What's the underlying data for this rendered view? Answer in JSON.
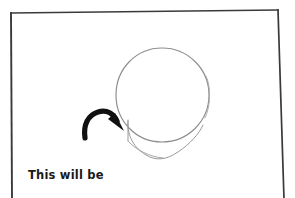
{
  "scene": {
    "kind": "hand-drawn-tutorial-frame",
    "background_color": "#ffffff",
    "ink_color": "#1a1a1a",
    "pencil_color": "#8a8a8a"
  },
  "frame": {
    "name": "paper-border",
    "stroke_color": "#3a3a3c",
    "stroke_width": 1.6,
    "corners": {
      "top_left": [
        11,
        13
      ],
      "top_right": [
        278,
        10
      ],
      "right_bottom": [
        284,
        198
      ],
      "left_bottom": [
        12,
        198
      ]
    }
  },
  "drawing": {
    "head_circle": {
      "name": "head-circle",
      "center_x": 162,
      "center_y": 95,
      "radius_x": 46,
      "radius_y": 47,
      "stroke_color": "#8d8d8d",
      "stroke_width": 1.1
    },
    "jaw_line": {
      "name": "jaw-line",
      "stroke_color": "#9a9a9a",
      "stroke_width": 1.0,
      "start": [
        128,
        122
      ],
      "chin": [
        163,
        159
      ],
      "end": [
        202,
        126
      ]
    },
    "cheek_line": {
      "name": "cheek-line",
      "stroke_color": "#9a9a9a",
      "stroke_width": 1.0,
      "start": [
        128,
        122
      ],
      "end": [
        128,
        140
      ]
    }
  },
  "arrow": {
    "name": "curved-pointer-arrow",
    "color": "#111111",
    "stroke_width": 5,
    "tail": [
      84,
      137
    ],
    "head": [
      121,
      129
    ],
    "direction": "down-right"
  },
  "annotation": {
    "name": "cheek-annotation",
    "line1": "This will be",
    "line2": "the cheek",
    "color": "#1a1a1a",
    "font_weight": "bold",
    "font_size_px": 11.5
  }
}
